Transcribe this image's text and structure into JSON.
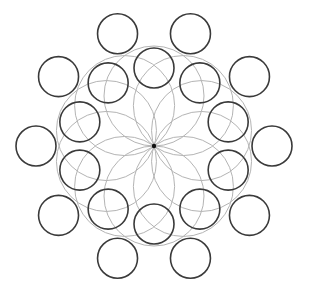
{
  "diagram": {
    "title": "Rosette circle pattern",
    "center": {
      "x": 154,
      "y": 146
    },
    "colors": {
      "background": "#ffffff",
      "dark_stroke": "#3a3a3a",
      "light_stroke": "#b4b4b4",
      "center_dot": "#111111"
    },
    "petal_ring": {
      "count": 10,
      "start_angle_deg": -90,
      "offset_radius": 50,
      "circle_radius": 50
    },
    "inner_ring": {
      "count": 10,
      "start_angle_deg": -90,
      "offset_radius": 78,
      "circle_radius": 20
    },
    "outer_ring": {
      "count": 10,
      "start_angle_deg": -72,
      "offset_radius": 118,
      "circle_radius": 20
    }
  }
}
